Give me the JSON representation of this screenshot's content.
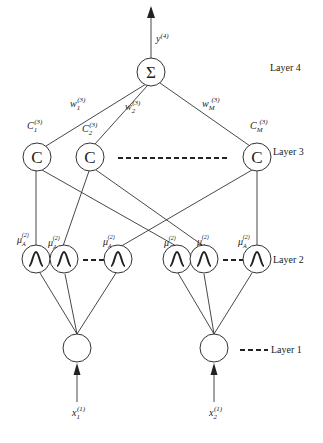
{
  "layers": {
    "layer4": {
      "label": "Layer 4",
      "node_symbol": "Σ",
      "output_label": "y",
      "output_sup": "(4)"
    },
    "layer3": {
      "label": "Layer 3",
      "node_symbol": "C",
      "nodes": [
        {
          "c_label": "C",
          "c_sub": "1",
          "c_sup": "(3)",
          "w_label": "w",
          "w_sub": "1",
          "w_sup": "(3)"
        },
        {
          "c_label": "C",
          "c_sub": "2",
          "c_sup": "(3)",
          "w_label": "w",
          "w_sub": "2",
          "w_sup": "(3)"
        },
        {
          "c_label": "C",
          "c_sub": "M",
          "c_sup": "(3)",
          "w_label": "w",
          "w_sub": "M",
          "w_sup": "(3)"
        }
      ]
    },
    "layer2": {
      "label": "Layer 2",
      "node_symbol": "Λ",
      "nodes": [
        {
          "mu": "μ",
          "sub": "A",
          "subsub": "1",
          "subsup": "1",
          "sup": "(2)"
        },
        {
          "mu": "μ",
          "sub": "A",
          "subsub": "1",
          "subsup": "2",
          "sup": "(2)"
        },
        {
          "mu": "μ",
          "sub": "A",
          "subsub": "1",
          "subsup": "N",
          "sup": "(2)"
        },
        {
          "mu": "μ",
          "sub": "A",
          "subsub": "2",
          "subsup": "1",
          "sup": "(2)"
        },
        {
          "mu": "μ",
          "sub": "A",
          "subsub": "2",
          "subsup": "2",
          "sup": "(2)"
        },
        {
          "mu": "μ",
          "sub": "A",
          "subsub": "2",
          "subsup": "N",
          "sup": "(2)"
        }
      ]
    },
    "layer1": {
      "label": "Layer 1",
      "inputs": [
        {
          "x_label": "x",
          "x_sub": "1",
          "x_sup": "(1)"
        },
        {
          "x_label": "x",
          "x_sub": "2",
          "x_sup": "(1)"
        }
      ]
    }
  }
}
